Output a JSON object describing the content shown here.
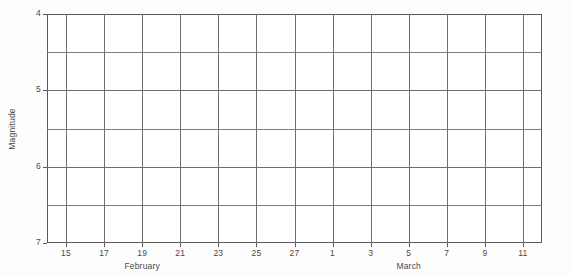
{
  "chart_data": {
    "type": "line",
    "title": "",
    "subtitle": "",
    "xlabel": "",
    "ylabel": "Magnitude",
    "series": [
      {
        "name": "light-curve",
        "x": [],
        "values": []
      }
    ],
    "x": [],
    "categories": [],
    "values": [],
    "annotations": [],
    "legend": {
      "entries": [],
      "position": "none",
      "visible": false
    },
    "grid": {
      "visible": true,
      "x_major_step_days": 2,
      "y_major_step": 0.5,
      "color": "#6e6e6e"
    },
    "axes": {
      "y": {
        "label": "Magnitude",
        "inverted": true,
        "lim": [
          7,
          4
        ],
        "top_value": 4,
        "bottom_value": 7,
        "major_ticks": [
          4,
          5,
          6,
          7
        ],
        "major_tick_labels": [
          "4",
          "5",
          "6",
          "7"
        ],
        "minor_gridlines": [
          4.5,
          5.5,
          6.5
        ]
      },
      "x": {
        "label": "",
        "lim_days": [
          14,
          12
        ],
        "start": "February 14",
        "end": "March 12",
        "tick_days": [
          15,
          17,
          19,
          21,
          23,
          25,
          27,
          1,
          3,
          5,
          7,
          9,
          11
        ],
        "tick_labels": [
          "15",
          "17",
          "19",
          "21",
          "23",
          "25",
          "27",
          "1",
          "3",
          "5",
          "7",
          "9",
          "11"
        ],
        "month_labels": [
          {
            "name": "February",
            "center_day_label": "19"
          },
          {
            "name": "March",
            "center_day_label": "5"
          }
        ]
      }
    },
    "colors": {
      "background": "#fdfdfd",
      "plot_background": "#ffffff",
      "grid": "#6e6e6e",
      "spine": "#5a5a5a",
      "text": "#4a4a4a"
    }
  },
  "yaxis": {
    "title": "Magnitude",
    "ticks": [
      {
        "label": "4",
        "value": 4
      },
      {
        "label": "5",
        "value": 5
      },
      {
        "label": "6",
        "value": 6
      },
      {
        "label": "7",
        "value": 7
      }
    ]
  },
  "xaxis": {
    "ticks": [
      {
        "label": "15"
      },
      {
        "label": "17"
      },
      {
        "label": "19"
      },
      {
        "label": "21"
      },
      {
        "label": "23"
      },
      {
        "label": "25"
      },
      {
        "label": "27"
      },
      {
        "label": "1"
      },
      {
        "label": "3"
      },
      {
        "label": "5"
      },
      {
        "label": "7"
      },
      {
        "label": "9"
      },
      {
        "label": "11"
      }
    ],
    "months": [
      {
        "label": "February"
      },
      {
        "label": "March"
      }
    ]
  }
}
